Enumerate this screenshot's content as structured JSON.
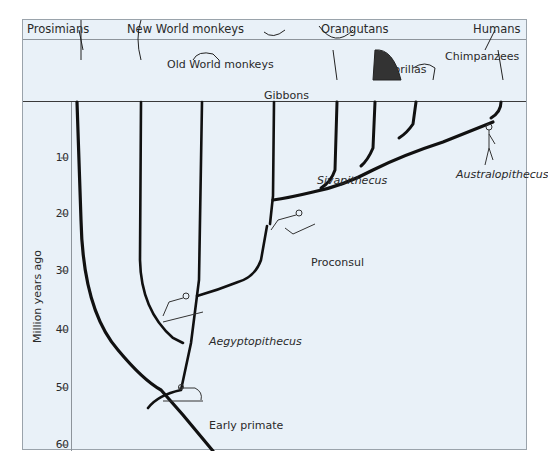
{
  "header": {
    "groups": [
      "Prosimians",
      "New World monkeys",
      "Orangutans",
      "Humans"
    ]
  },
  "taxa_labels": {
    "old_world": "Old World monkeys",
    "gibbons": "Gibbons",
    "gorillas": "Gorillas",
    "chimpanzees": "Chimpanzees"
  },
  "fossils": {
    "sivapithecus": "Sivapithecus",
    "australopithecus": "Australopithecus",
    "proconsul": "Proconsul",
    "aegyptopithecus": "Aegyptopithecus",
    "early_primate": "Early primate"
  },
  "axis": {
    "label": "Million years ago",
    "ticks": [
      "10",
      "20",
      "30",
      "40",
      "50",
      "60"
    ]
  },
  "colors": {
    "background": "#e9f1f8",
    "branch": "#111111",
    "frame": "#9aa3ab"
  }
}
